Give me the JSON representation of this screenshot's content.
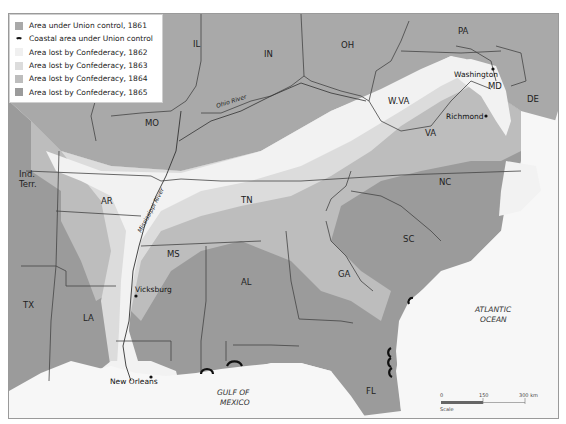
{
  "legend": {
    "items": [
      {
        "label": "Area under Union control, 1861",
        "color": "#a9a9a9",
        "kind": "swatch"
      },
      {
        "label": "Coastal area under Union control",
        "color": "#111111",
        "kind": "arc"
      },
      {
        "label": "Area lost by Confederacy, 1862",
        "color": "#f2f2f2",
        "kind": "swatch"
      },
      {
        "label": "Area lost by Confederacy, 1863",
        "color": "#dcdcdc",
        "kind": "swatch"
      },
      {
        "label": "Area lost by Confederacy, 1864",
        "color": "#bdbdbd",
        "kind": "swatch"
      },
      {
        "label": "Area lost by Confederacy, 1865",
        "color": "#9b9b9b",
        "kind": "swatch"
      }
    ]
  },
  "states": {
    "IL": "IL",
    "IN": "IN",
    "OH": "OH",
    "PA": "PA",
    "MD": "MD",
    "DE": "DE",
    "WVA": "W.VA",
    "VA": "VA",
    "MO": "MO",
    "IND1": "Ind.",
    "IND2": "Terr.",
    "AR": "AR",
    "TN": "TN",
    "NC": "NC",
    "SC": "SC",
    "MS": "MS",
    "AL": "AL",
    "GA": "GA",
    "TX": "TX",
    "LA": "LA",
    "FL": "FL"
  },
  "cities": {
    "washington": "Washington",
    "richmond": "Richmond",
    "vicksburg": "Vicksburg",
    "new_orleans": "New Orleans"
  },
  "water": {
    "ohio_river": "Ohio River",
    "mississippi_river": "Mississippi River",
    "gulf1": "GULF OF",
    "gulf2": "MEXICO",
    "atlantic1": "ATLANTIC",
    "atlantic2": "OCEAN"
  },
  "scale": {
    "label": "Scale",
    "ticks": [
      "0",
      "150",
      "300 km"
    ]
  },
  "colors": {
    "union1861": "#a9a9a9",
    "lost1862": "#f2f2f2",
    "lost1863": "#dcdcdc",
    "lost1864": "#bdbdbd",
    "lost1865": "#9b9b9b",
    "sea": "#f7f7f7",
    "border": "#444444"
  }
}
